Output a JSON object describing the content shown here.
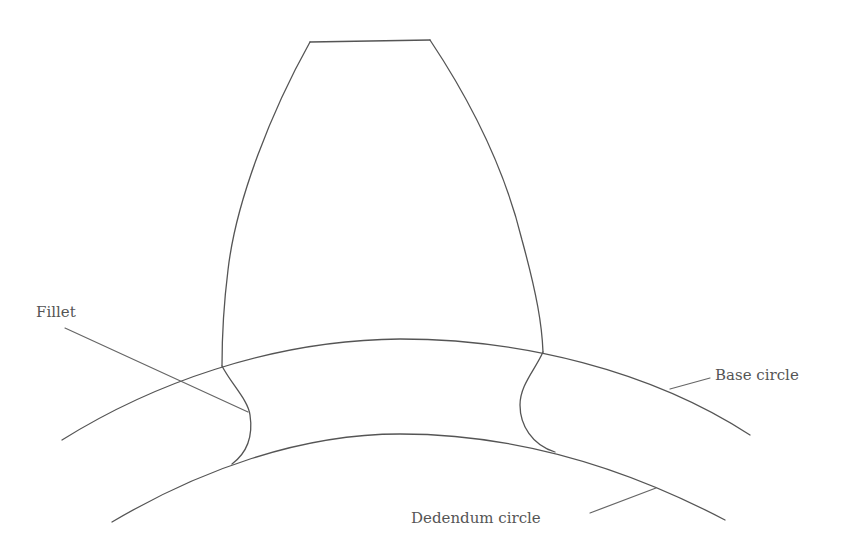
{
  "diagram": {
    "type": "gear-tooth-profile",
    "stroke_color": "#555555",
    "label_color": "#555555",
    "labels": {
      "fillet": "Fillet",
      "base_circle": "Base circle",
      "dedendum_circle": "Dedendum circle"
    },
    "elements": [
      {
        "name": "tooth-tip",
        "description": "Top land of the gear tooth"
      },
      {
        "name": "left-flank",
        "description": "Involute flank on left side of tooth"
      },
      {
        "name": "right-flank",
        "description": "Involute flank on right side of tooth"
      },
      {
        "name": "base-circle",
        "description": "Arc marking the base circle"
      },
      {
        "name": "dedendum-circle",
        "description": "Arc marking the dedendum (root) circle"
      },
      {
        "name": "left-fillet",
        "description": "Fillet curve between flank and root, left"
      },
      {
        "name": "right-fillet",
        "description": "Fillet curve between flank and root, right"
      }
    ]
  }
}
